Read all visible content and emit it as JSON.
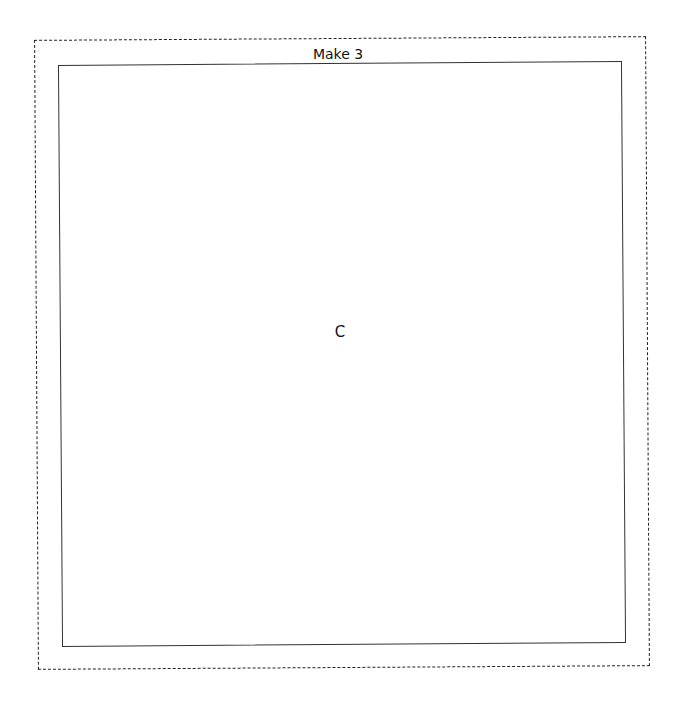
{
  "page": {
    "label": "Make 3",
    "card_letter": "C"
  },
  "style": {
    "line_color": "#222222",
    "background": "#ffffff"
  }
}
